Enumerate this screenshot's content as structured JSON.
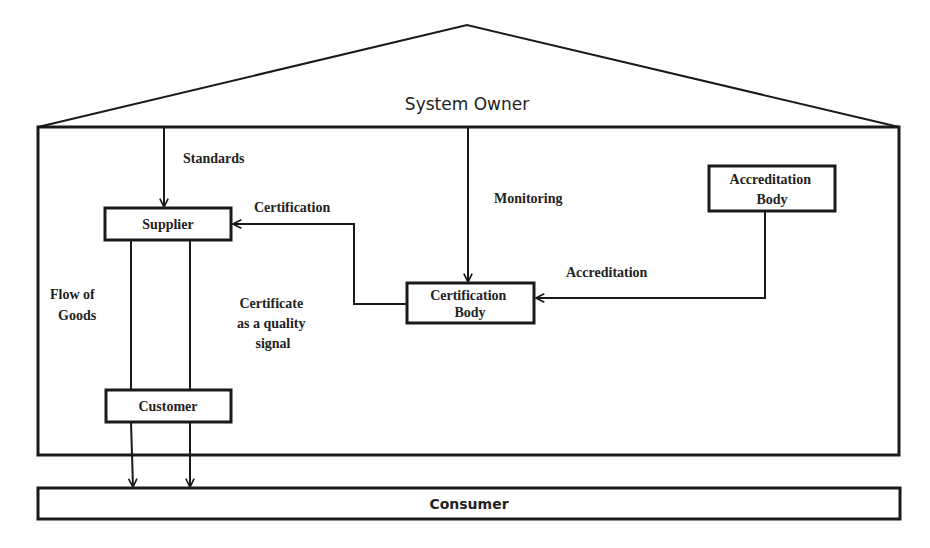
{
  "diagram": {
    "title": "System Owner",
    "nodes": {
      "supplier": "Supplier",
      "customer": "Customer",
      "certification_body": [
        "Certification",
        "Body"
      ],
      "accreditation_body": [
        "Accreditation",
        "Body"
      ],
      "consumer": "Consumer"
    },
    "edge_labels": {
      "standards": "Standards",
      "monitoring": "Monitoring",
      "certification": "Certification",
      "accreditation": "Accreditation",
      "flow_of_goods": [
        "Flow of",
        "Goods"
      ],
      "certificate_signal": [
        "Certificate",
        "as a quality",
        "signal"
      ]
    },
    "colors": {
      "stroke": "#1a1a1a",
      "text": "#222222",
      "background": "#ffffff"
    }
  }
}
